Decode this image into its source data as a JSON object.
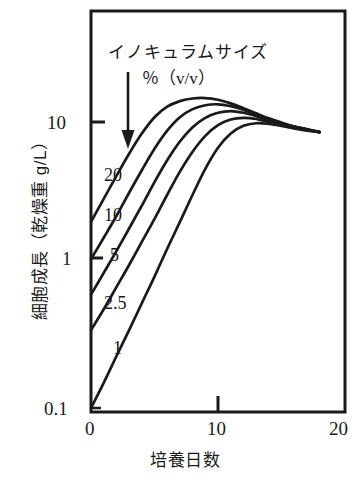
{
  "chart_data": {
    "type": "line",
    "title": "",
    "xlabel": "培養日数",
    "ylabel": "細胞成長（乾燥重 g/L）",
    "legend_title": "イノキュラムサイズ",
    "legend_units": "％（v/v）",
    "legend_position": "inside-top-left",
    "grid": false,
    "yscale": "log",
    "xlim": [
      0,
      20
    ],
    "ylim": [
      0.1,
      30
    ],
    "xticks": [
      "0",
      "10",
      "20"
    ],
    "xtick_values": [
      0,
      10,
      20
    ],
    "yticks": [
      "10",
      "1",
      "0.1"
    ],
    "ytick_values": [
      10,
      1,
      0.1
    ],
    "annotation_arrow": "downward-arrow-from-legend-to-curves",
    "series": [
      {
        "name": "20",
        "label": "20",
        "x": [
          0,
          1,
          2,
          3,
          4,
          5,
          6,
          7,
          8,
          9,
          10,
          11,
          12,
          13,
          14,
          15,
          16,
          17,
          18
        ],
        "y": [
          2.0,
          2.9,
          4.2,
          6.0,
          8.3,
          10.8,
          12.8,
          14.0,
          14.6,
          14.7,
          14.3,
          13.5,
          12.5,
          11.5,
          10.6,
          9.9,
          9.3,
          8.9,
          8.5
        ]
      },
      {
        "name": "10",
        "label": "10",
        "x": [
          0,
          1,
          2,
          3,
          4,
          5,
          6,
          7,
          8,
          9,
          10,
          11,
          12,
          13,
          14,
          15,
          16,
          17,
          18
        ],
        "y": [
          1.1,
          1.55,
          2.2,
          3.2,
          4.6,
          6.5,
          8.7,
          10.8,
          12.3,
          13.1,
          13.3,
          12.9,
          12.2,
          11.3,
          10.5,
          9.8,
          9.3,
          8.9,
          8.5
        ]
      },
      {
        "name": "5",
        "label": "5",
        "x": [
          0,
          1,
          2,
          3,
          4,
          5,
          6,
          7,
          8,
          9,
          10,
          11,
          12,
          13,
          14,
          15,
          16,
          17,
          18
        ],
        "y": [
          0.62,
          0.88,
          1.25,
          1.8,
          2.6,
          3.8,
          5.4,
          7.3,
          9.2,
          10.7,
          11.6,
          11.9,
          11.6,
          11.0,
          10.3,
          9.7,
          9.2,
          8.8,
          8.5
        ]
      },
      {
        "name": "2.5",
        "label": "2.5",
        "x": [
          0,
          1,
          2,
          3,
          4,
          5,
          6,
          7,
          8,
          9,
          10,
          11,
          12,
          13,
          14,
          15,
          16,
          17,
          18
        ],
        "y": [
          0.35,
          0.49,
          0.7,
          1.0,
          1.45,
          2.1,
          3.1,
          4.5,
          6.2,
          8.0,
          9.5,
          10.4,
          10.7,
          10.5,
          10.0,
          9.6,
          9.1,
          8.8,
          8.5
        ]
      },
      {
        "name": "1",
        "label": "1",
        "x": [
          0,
          1,
          2,
          3,
          4,
          5,
          6,
          7,
          8,
          9,
          10,
          11,
          12,
          13,
          14,
          15,
          16,
          17,
          18
        ],
        "y": [
          0.1,
          0.15,
          0.23,
          0.35,
          0.54,
          0.83,
          1.3,
          2.0,
          3.1,
          4.7,
          6.6,
          8.3,
          9.4,
          9.8,
          9.7,
          9.4,
          9.0,
          8.7,
          8.5
        ]
      }
    ]
  },
  "style": {
    "line_color": "#1a1a1a",
    "axis_color": "#1a1a1a",
    "background": "#ffffff"
  }
}
